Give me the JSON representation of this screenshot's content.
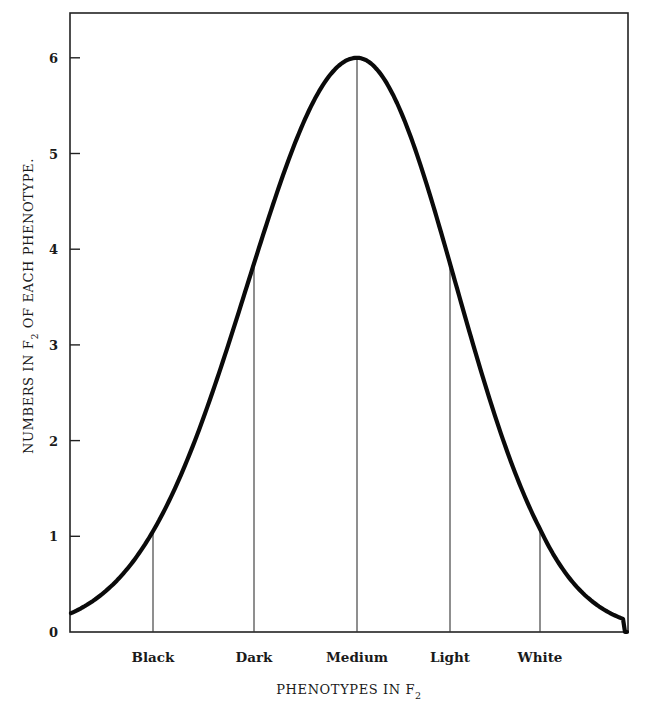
{
  "chart_data": {
    "type": "line",
    "title": "",
    "xlabel": "PHENOTYPES IN F",
    "xlabel_subscript": "2",
    "ylabel_prefix": "NUMBERS IN F",
    "ylabel_subscript": "2",
    "ylabel_suffix": " OF EACH PHENOTYPE.",
    "ylim": [
      0,
      6.5
    ],
    "yticks": [
      0,
      1,
      2,
      3,
      4,
      5,
      6
    ],
    "ytick_labels": [
      "0",
      "1",
      "2",
      "3",
      "4",
      "5",
      "6"
    ],
    "categories": [
      "Black",
      "Dark",
      "Medium",
      "Light",
      "White"
    ],
    "values": [
      0.87,
      3.85,
      6.0,
      3.85,
      0.86
    ],
    "curve": {
      "shape": "bell (normal distribution)",
      "peak_value": 6.0,
      "endpoint_values": [
        0.03,
        0.0
      ]
    },
    "grid": false,
    "legend": "none",
    "vertical_drop_lines": true
  }
}
